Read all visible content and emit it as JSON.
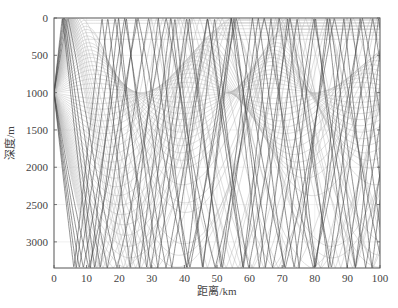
{
  "chart_data": {
    "type": "line",
    "title": "",
    "xlabel": "距离/km",
    "ylabel": "深度/m",
    "xlim": [
      0,
      100
    ],
    "ylim": [
      3350,
      0
    ],
    "y_inverted": true,
    "grid": true,
    "legend": null,
    "xticks": [
      0,
      10,
      20,
      30,
      40,
      50,
      60,
      70,
      80,
      90,
      100
    ],
    "yticks": [
      0,
      500,
      1000,
      1500,
      2000,
      2500,
      3000
    ],
    "source": {
      "range_km": 0,
      "depth_m": 1000
    },
    "series": [
      {
        "name": "bottom-reflected rays (steep, dark)",
        "color": "#555555",
        "bottom_hits_km": [
          13,
          14,
          20,
          22,
          48,
          50,
          56,
          57,
          63,
          64,
          85,
          92,
          97
        ],
        "surface_hits_km": [
          4,
          35,
          41,
          70,
          76
        ]
      },
      {
        "name": "refracted rays (shallow, light)",
        "color": "#b0b0b0",
        "surface_turning_km": [
          3,
          5,
          40,
          43,
          75,
          77
        ],
        "caustic_depth_m": 1000,
        "caustic_range_km": [
          28,
          30,
          62,
          85
        ]
      }
    ]
  },
  "axes": {
    "x_label": "距离/km",
    "y_label": "深度/m",
    "x_tick_labels": [
      "0",
      "10",
      "20",
      "30",
      "40",
      "50",
      "60",
      "70",
      "80",
      "90",
      "100"
    ],
    "y_tick_labels": [
      "0",
      "500",
      "1000",
      "1500",
      "2000",
      "2500",
      "3000"
    ]
  },
  "colors": {
    "dark_ray": "#4a4a4a",
    "light_ray": "#b5b5b5",
    "axis": "#555555",
    "grid": "#e6e6e6"
  }
}
